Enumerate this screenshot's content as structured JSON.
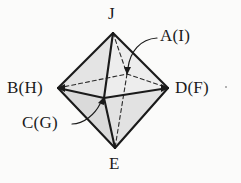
{
  "figure": {
    "name": "octahedron-diagram",
    "background_color": "#fbfbfa",
    "stroke_color": "#1a1a1a",
    "face_fill_light": "#e6e6e6",
    "face_fill_mid": "#dcdcdc",
    "face_fill_dark": "#cfcfcf",
    "labels": {
      "top": "J",
      "bottom": "E",
      "left": "B(H)",
      "right": "D(F)",
      "rear_center": "A(I)",
      "front_center": "C(G)"
    }
  }
}
